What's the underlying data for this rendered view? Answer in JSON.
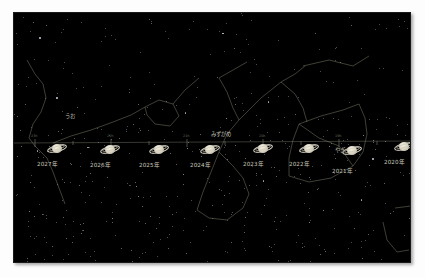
{
  "chart_data": {
    "type": "scatter",
    "xlabel": "",
    "ylabel": "",
    "background_color": "#000000",
    "line_color": "#7a7f6a",
    "star_color": "#cfd6e4",
    "label_color": "#c9c9bb",
    "grid": false,
    "legend": "none",
    "ecliptic": {
      "label": "ecliptic-line",
      "y_px": 131,
      "ticks_px": [
        22,
        60,
        98,
        136,
        174,
        212,
        250,
        288,
        326,
        364,
        400
      ]
    },
    "planet": "saturn",
    "points": [
      {
        "year_label": "2027年",
        "x_px": 44,
        "y_px": 136
      },
      {
        "year_label": "2026年",
        "x_px": 97,
        "y_px": 137
      },
      {
        "year_label": "2025年",
        "x_px": 146,
        "y_px": 137
      },
      {
        "year_label": "2024年",
        "x_px": 197,
        "y_px": 137
      },
      {
        "year_label": "2023年",
        "x_px": 250,
        "y_px": 136
      },
      {
        "year_label": "2022年",
        "x_px": 296,
        "y_px": 136
      },
      {
        "year_label": "2021年",
        "x_px": 339,
        "y_px": 138
      },
      {
        "year_label": "2020年",
        "x_px": 391,
        "y_px": 134
      }
    ],
    "constellations": [
      {
        "name": "うお",
        "romaji": "Pisces",
        "label_x_px": 64,
        "label_y_px": 115
      },
      {
        "name": "みずがめ",
        "romaji": "Aquarius",
        "label_x_px": 225,
        "label_y_px": 133
      },
      {
        "name": "やぎ",
        "romaji": "Capricornus",
        "label_x_px": 336,
        "label_y_px": 148
      }
    ],
    "ra_ticks": [
      {
        "label": "23h",
        "x_px": 22
      },
      {
        "label": "22h",
        "x_px": 98
      },
      {
        "label": "21h",
        "x_px": 174
      },
      {
        "label": "20h",
        "x_px": 250
      },
      {
        "label": "19h",
        "x_px": 326
      }
    ]
  },
  "labels": {
    "y2027": "2027年",
    "y2026": "2026年",
    "y2025": "2025年",
    "y2024": "2024年",
    "y2023": "2023年",
    "y2022": "2022年",
    "y2021": "2021年",
    "y2020": "2020年",
    "pisces": "うお",
    "aquarius": "みずがめ",
    "capricornus": "やぎ"
  }
}
